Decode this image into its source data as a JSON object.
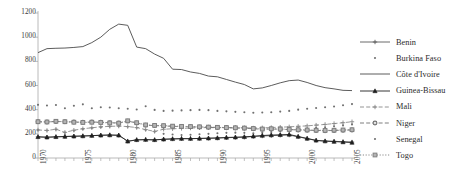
{
  "chart_data": {
    "type": "line",
    "title": "",
    "subtitle": "",
    "xlabel": "",
    "ylabel": "",
    "xlim": [
      1970,
      2005
    ],
    "ylim": [
      0,
      1200
    ],
    "grid": false,
    "legend_position": "right",
    "y_ticks": [
      "0",
      "200",
      "400",
      "600",
      "800",
      "1000",
      "1200"
    ],
    "y_tick_values": [
      0,
      200,
      400,
      600,
      800,
      1000,
      1200
    ],
    "x_ticks": [
      "1970",
      "1975",
      "1980",
      "1985",
      "1990",
      "1995",
      "2000",
      "2005"
    ],
    "x_tick_values": [
      1970,
      1975,
      1980,
      1985,
      1990,
      1995,
      2000,
      2005
    ],
    "x": [
      1970,
      1971,
      1972,
      1973,
      1974,
      1975,
      1976,
      1977,
      1978,
      1979,
      1980,
      1981,
      1982,
      1983,
      1984,
      1985,
      1986,
      1987,
      1988,
      1989,
      1990,
      1991,
      1992,
      1993,
      1994,
      1995,
      1996,
      1997,
      1998,
      1999,
      2000,
      2001,
      2002,
      2003,
      2004,
      2005
    ],
    "series": [
      {
        "name": "Benin",
        "marker": "plus",
        "line_style": "solid",
        "color": "#5a5a5a",
        "values": [
          175,
          172,
          175,
          178,
          180,
          182,
          185,
          188,
          190,
          188,
          140,
          150,
          152,
          150,
          155,
          158,
          160,
          160,
          162,
          163,
          165,
          168,
          170,
          172,
          178,
          182,
          185,
          188,
          190,
          175,
          160,
          145,
          140,
          138,
          135,
          132
        ]
      },
      {
        "name": "Burkina Faso",
        "marker": "dot",
        "line_style": "none",
        "color": "#707070",
        "values": [
          232,
          228,
          235,
          210,
          225,
          240,
          248,
          255,
          260,
          262,
          258,
          250,
          232,
          218,
          200,
          195,
          190,
          192,
          196,
          200,
          205,
          208,
          210,
          208,
          205,
          210,
          215,
          222,
          232,
          238,
          244,
          250,
          255,
          262,
          270,
          278
        ]
      },
      {
        "name": "Côte d'Ivoire",
        "marker": "none",
        "line_style": "solid",
        "color": "#4a4a4a",
        "values": [
          872,
          905,
          908,
          910,
          915,
          922,
          955,
          1000,
          1065,
          1108,
          1098,
          918,
          905,
          860,
          825,
          735,
          732,
          712,
          700,
          678,
          672,
          650,
          628,
          608,
          572,
          580,
          600,
          622,
          640,
          645,
          625,
          600,
          582,
          572,
          560,
          558
        ]
      },
      {
        "name": "Guinea-Bissau",
        "marker": "triangle",
        "line_style": "solid",
        "color": "#1f1f1f",
        "values": [
          175,
          172,
          175,
          178,
          180,
          182,
          185,
          188,
          190,
          188,
          138,
          150,
          152,
          150,
          155,
          158,
          160,
          160,
          162,
          164,
          166,
          170,
          172,
          175,
          180,
          186,
          190,
          192,
          195,
          178,
          162,
          146,
          140,
          136,
          132,
          128
        ]
      },
      {
        "name": "Mali",
        "marker": "plus",
        "line_style": "dashed",
        "color": "#888888",
        "values": [
          232,
          228,
          238,
          212,
          230,
          242,
          250,
          258,
          262,
          264,
          260,
          252,
          235,
          220,
          238,
          242,
          245,
          248,
          250,
          252,
          250,
          252,
          252,
          250,
          248,
          250,
          252,
          255,
          258,
          262,
          266,
          272,
          278,
          285,
          292,
          300
        ]
      },
      {
        "name": "Niger",
        "marker": "circle",
        "line_style": "dashed",
        "color": "#6f6f6f",
        "values": [
          300,
          298,
          302,
          300,
          298,
          296,
          298,
          296,
          292,
          290,
          305,
          290,
          272,
          268,
          265,
          262,
          260,
          258,
          256,
          254,
          252,
          250,
          248,
          246,
          242,
          238,
          240,
          238,
          235,
          232,
          230,
          228,
          226,
          228,
          230,
          232
        ]
      },
      {
        "name": "Senegal",
        "marker": "dot",
        "line_style": "none",
        "color": "#707070",
        "values": [
          440,
          434,
          438,
          412,
          432,
          444,
          412,
          420,
          418,
          412,
          408,
          402,
          428,
          398,
          390,
          392,
          394,
          396,
          398,
          396,
          390,
          386,
          382,
          378,
          374,
          376,
          378,
          384,
          390,
          400,
          408,
          414,
          420,
          426,
          436,
          446
        ]
      },
      {
        "name": "Togo",
        "marker": "square",
        "line_style": "dotted",
        "color": "#7d7d7d",
        "values": [
          300,
          298,
          304,
          300,
          296,
          294,
          296,
          294,
          290,
          288,
          308,
          292,
          274,
          270,
          268,
          264,
          262,
          260,
          258,
          256,
          254,
          252,
          250,
          248,
          244,
          240,
          242,
          240,
          236,
          234,
          232,
          230,
          228,
          230,
          232,
          234
        ]
      }
    ]
  },
  "legend": {
    "items": [
      {
        "label": "Benin",
        "key": "legend-key-benin"
      },
      {
        "label": "Burkina Faso",
        "key": "legend-key-burkina-faso"
      },
      {
        "label": "Côte d'Ivoire",
        "key": "legend-key-cote-divoire"
      },
      {
        "label": "Guinea-Bissau",
        "key": "legend-key-guinea-bissau"
      },
      {
        "label": "Mali",
        "key": "legend-key-mali"
      },
      {
        "label": "Niger",
        "key": "legend-key-niger"
      },
      {
        "label": "Senegal",
        "key": "legend-key-senegal"
      },
      {
        "label": "Togo",
        "key": "legend-key-togo"
      }
    ]
  },
  "colors": {
    "axis": "#a8a8a8",
    "text": "#3a3a3a",
    "background": "#ffffff"
  }
}
